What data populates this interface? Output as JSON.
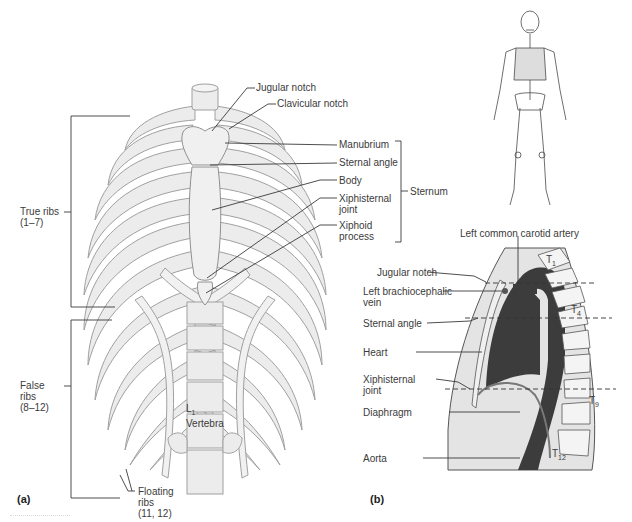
{
  "figure": {
    "panel_a": {
      "tag": "(a)",
      "view": "anterior view of thoracic cage",
      "labels": {
        "jugular_notch": "Jugular notch",
        "clavicular_notch": "Clavicular notch",
        "manubrium": "Manubrium",
        "sternal_angle": "Sternal angle",
        "body": "Body",
        "xiphisternal_joint_1": "Xiphisternal",
        "xiphisternal_joint_2": "joint",
        "xiphoid_process_1": "Xiphoid",
        "xiphoid_process_2": "process",
        "sternum": "Sternum",
        "true_ribs_1": "True ribs",
        "true_ribs_2": "(1–7)",
        "false_ribs_1": "False",
        "false_ribs_2": "ribs",
        "false_ribs_3": "(8–12)",
        "floating_ribs_1": "Floating",
        "floating_ribs_2": "ribs",
        "floating_ribs_3": "(11, 12)",
        "l1_main": "L",
        "l1_sub": "1",
        "vertebra": "Vertebra"
      }
    },
    "panel_b": {
      "tag": "(b)",
      "view": "midsagittal section of thorax",
      "labels": {
        "left_common_carotid": "Left common carotid artery",
        "jugular_notch": "Jugular notch",
        "left_brachiocephalic_1": "Left brachiocephalic",
        "left_brachiocephalic_2": "vein",
        "sternal_angle": "Sternal angle",
        "heart": "Heart",
        "xiphisternal_1": "Xiphisternal",
        "xiphisternal_2": "joint",
        "diaphragm": "Diaphragm",
        "aorta": "Aorta"
      },
      "vertebrae": [
        {
          "main": "T",
          "sub": "1"
        },
        {
          "main": "T",
          "sub": "4"
        },
        {
          "main": "T",
          "sub": "9"
        },
        {
          "main": "T",
          "sub": "12"
        }
      ]
    },
    "inset": {
      "description": "full skeleton orientation figure"
    },
    "colors": {
      "bone_fill": "#ececec",
      "bone_stroke": "#9a9a9a",
      "leader_line": "#3a3a3a",
      "organ_dark": "#3c3c3c",
      "section_fill": "#e4e4e4"
    }
  }
}
